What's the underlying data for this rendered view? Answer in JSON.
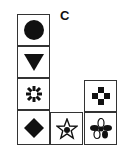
{
  "label": "C",
  "grid": {
    "cells": [
      {
        "row": 0,
        "col": 0,
        "symbol": "filled-circle"
      },
      {
        "row": 1,
        "col": 0,
        "symbol": "filled-down-triangle"
      },
      {
        "row": 2,
        "col": 0,
        "symbol": "asterisk"
      },
      {
        "row": 2,
        "col": 2,
        "symbol": "cross-with-hollow-center"
      },
      {
        "row": 3,
        "col": 0,
        "symbol": "filled-diamond"
      },
      {
        "row": 3,
        "col": 1,
        "symbol": "outlined-star-with-dot"
      },
      {
        "row": 3,
        "col": 2,
        "symbol": "four-petal-flower"
      }
    ]
  }
}
